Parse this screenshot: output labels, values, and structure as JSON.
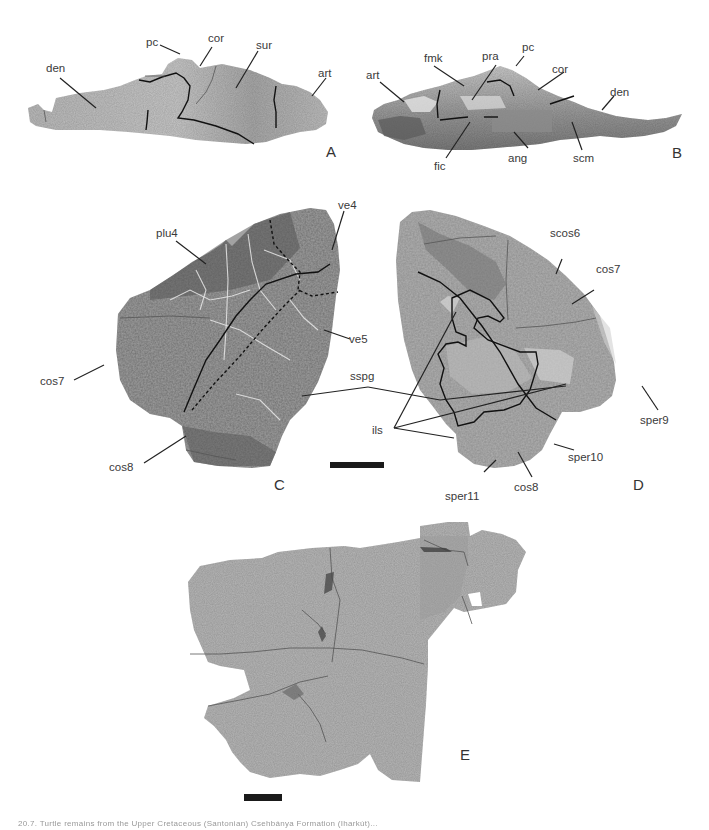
{
  "figure": {
    "panels": {
      "A": {
        "letter": "A",
        "description": "lower jaw, lateral view",
        "labels": {
          "den": "den",
          "pc": "pc",
          "cor": "cor",
          "sur": "sur",
          "art": "art"
        }
      },
      "B": {
        "letter": "B",
        "description": "lower jaw, medial view",
        "labels": {
          "art": "art",
          "fmk": "fmk",
          "pra": "pra",
          "pc": "pc",
          "cor": "cor",
          "den": "den",
          "fic": "fic",
          "ang": "ang",
          "scm": "scm"
        }
      },
      "C": {
        "letter": "C",
        "description": "carapace fragment, external view",
        "labels": {
          "plu4": "plu4",
          "ve4": "ve4",
          "ve5": "ve5",
          "cos7": "cos7",
          "cos8": "cos8"
        }
      },
      "D": {
        "letter": "D",
        "description": "carapace fragment, internal view",
        "labels": {
          "scos6": "scos6",
          "cos7": "cos7",
          "sper9": "sper9",
          "sper10": "sper10",
          "sper11": "sper11",
          "cos8": "cos8",
          "ils": "ils"
        }
      },
      "E": {
        "letter": "E",
        "description": "plastron/carapace fragment"
      }
    },
    "shared_labels": {
      "sspg": "sspg"
    },
    "scale_bars": [
      "scale-bar-CD",
      "scale-bar-E"
    ],
    "caption": "20.7. Turtle remains from the Upper Cretaceous (Santonian) Csehbánya Formation (Iharkút)..."
  }
}
